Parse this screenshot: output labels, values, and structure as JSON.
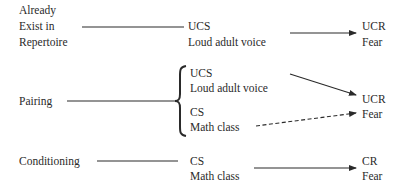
{
  "diagram": {
    "type": "classical-conditioning-flow",
    "rows": [
      {
        "stage_label_lines": [
          "Already",
          "Exist in",
          "Repertoire"
        ],
        "stimuli": [
          {
            "code": "UCS",
            "desc": "Loud adult voice"
          }
        ],
        "response": {
          "code": "UCR",
          "desc": "Fear"
        },
        "arrows": [
          {
            "from": "UCS",
            "to": "UCR",
            "style": "solid"
          }
        ]
      },
      {
        "stage_label_lines": [
          "Pairing"
        ],
        "stimuli": [
          {
            "code": "UCS",
            "desc": "Loud adult voice"
          },
          {
            "code": "CS",
            "desc": "Math class"
          }
        ],
        "response": {
          "code": "UCR",
          "desc": "Fear"
        },
        "arrows": [
          {
            "from": "UCS",
            "to": "UCR",
            "style": "solid"
          },
          {
            "from": "CS",
            "to": "UCR",
            "style": "dashed"
          }
        ]
      },
      {
        "stage_label_lines": [
          "Conditioning"
        ],
        "stimuli": [
          {
            "code": "CS",
            "desc": "Math class"
          }
        ],
        "response": {
          "code": "CR",
          "desc": "Fear"
        },
        "arrows": [
          {
            "from": "CS",
            "to": "CR",
            "style": "solid"
          }
        ]
      }
    ]
  }
}
